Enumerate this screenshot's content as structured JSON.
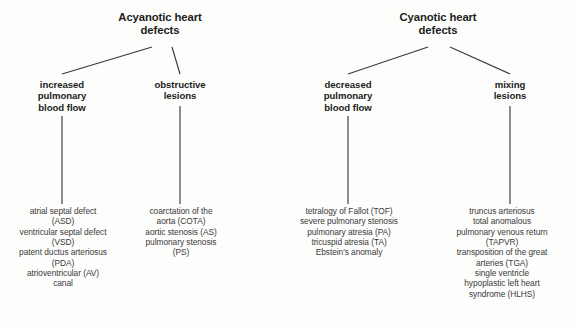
{
  "diagram": {
    "type": "tree",
    "trees": [
      {
        "id": "acyanotic",
        "root": {
          "label": "Acyanotic heart\ndefects",
          "lines": [
            "Acyanotic heart",
            "defects"
          ]
        },
        "branches": [
          {
            "id": "increased-pulmonary-blood-flow",
            "category": {
              "lines": [
                "increased",
                "pulmonary",
                "blood  flow"
              ]
            },
            "items": [
              "atrial septal defect",
              "(ASD)",
              "ventricular septal defect",
              "(VSD)",
              "patent ductus arteriosus",
              "(PDA)",
              "atrioventricular (AV)",
              "canal"
            ]
          },
          {
            "id": "obstructive-lesions",
            "category": {
              "lines": [
                "obstructive",
                "lesions"
              ]
            },
            "items": [
              "coarctation of the",
              "aorta (COTA)",
              "aortic stenosis (AS)",
              "pulmonary stenosis",
              "(PS)"
            ]
          }
        ]
      },
      {
        "id": "cyanotic",
        "root": {
          "label": "Cyanotic heart\ndefects",
          "lines": [
            "Cyanotic heart",
            "defects"
          ]
        },
        "branches": [
          {
            "id": "decreased-pulmonary-blood-flow",
            "category": {
              "lines": [
                "decreased",
                "pulmonary",
                "blood  flow"
              ]
            },
            "items": [
              "tetralogy of Fallot (TOF)",
              "severe pulmonary stenosis",
              "pulmonary atresia (PA)",
              "tricuspid atresia (TA)",
              "Ebstein's anomaly"
            ]
          },
          {
            "id": "mixing-lesions",
            "category": {
              "lines": [
                "mixing",
                "lesions"
              ]
            },
            "items": [
              "truncus arteriosus",
              "total anomalous",
              "pulmonary venous return",
              "(TAPVR)",
              "transposition of the great",
              "arteries (TGA)",
              "single ventricle",
              "hypoplastic left heart",
              "syndrome (HLHS)"
            ]
          }
        ]
      }
    ],
    "colors": {
      "background": "#fdfdfb",
      "line": "#3a3a3a",
      "title_text": "#1d1d1d",
      "body_text": "#3b3b3b"
    }
  }
}
